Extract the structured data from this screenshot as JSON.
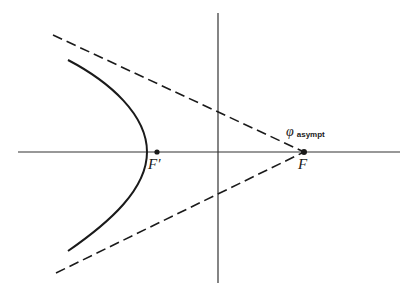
{
  "figure": {
    "colors": {
      "stroke": "#1a1a1a",
      "axis": "#333333",
      "background": "#ffffff"
    },
    "labels": {
      "focus_right": "F",
      "focus_left": "F′",
      "angle_symbol": "φ",
      "angle_subscript": "asympt"
    },
    "axes": {
      "horizontal": {
        "x1": 18,
        "y1": 152,
        "x2": 400,
        "y2": 152
      },
      "vertical": {
        "x1": 218,
        "y1": 13,
        "x2": 218,
        "y2": 283
      }
    },
    "points": {
      "F": {
        "x": 304,
        "y": 152
      },
      "F_prime": {
        "x": 157,
        "y": 152
      }
    },
    "asymptotes": [
      {
        "name": "upper",
        "x1": 53,
        "y1": 35,
        "x2": 304,
        "y2": 152
      },
      {
        "name": "lower",
        "x1": 56,
        "y1": 273,
        "x2": 304,
        "y2": 152
      }
    ],
    "hyperbola": {
      "vertex": {
        "x": 147,
        "y": 152
      },
      "upper_end": {
        "x": 68,
        "y": 60
      },
      "lower_end": {
        "x": 68,
        "y": 251
      }
    }
  }
}
